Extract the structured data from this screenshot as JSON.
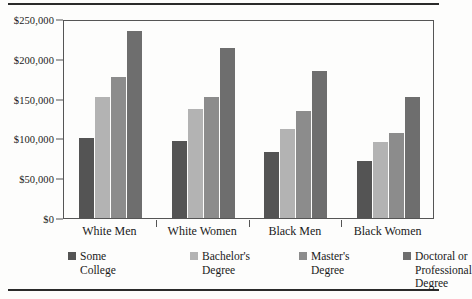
{
  "chart_data": {
    "type": "bar",
    "title": "",
    "subtitle": "",
    "xlabel": "",
    "ylabel": "",
    "categories": [
      "White Men",
      "White Women",
      "Black Men",
      "Black Women"
    ],
    "series": [
      {
        "name": "Some College",
        "color": "#545454",
        "values": [
          101000,
          97000,
          83000,
          71000
        ]
      },
      {
        "name": "Bachelor's Degree",
        "color": "#b3b3b3",
        "values": [
          152000,
          137000,
          112000,
          96000
        ]
      },
      {
        "name": "Master's Degree",
        "color": "#8c8c8c",
        "values": [
          177000,
          152000,
          134000,
          107000
        ]
      },
      {
        "name": "Doctoral or Professional Degree",
        "color": "#6e6e6e",
        "values": [
          235000,
          214000,
          185000,
          152000
        ]
      }
    ],
    "ylim": [
      0,
      250000
    ],
    "ytick_values": [
      0,
      50000,
      100000,
      150000,
      200000,
      250000
    ],
    "ytick_labels": [
      "$0",
      "$50,000",
      "$100,000",
      "$150,000",
      "$200,000",
      "$250,000"
    ],
    "grid": false,
    "legend_position": "bottom"
  },
  "legend": {
    "items": [
      {
        "label": "Some\nCollege",
        "color": "#545454"
      },
      {
        "label": "Bachelor's\nDegree",
        "color": "#b3b3b3"
      },
      {
        "label": "Master's\nDegree",
        "color": "#8c8c8c"
      },
      {
        "label": "Doctoral or\nProfessional Degree",
        "color": "#6e6e6e"
      }
    ]
  },
  "axis": {
    "y_labels": [
      "$250,000",
      "$200,000",
      "$150,000",
      "$100,000",
      "$50,000",
      "$0"
    ],
    "x_labels": [
      "White Men",
      "White Women",
      "Black Men",
      "Black Women"
    ]
  },
  "colors": {
    "rule": "#2a2a2a",
    "axis": "#555555",
    "background": "#fdfdfc",
    "text": "#1a1a1a"
  }
}
